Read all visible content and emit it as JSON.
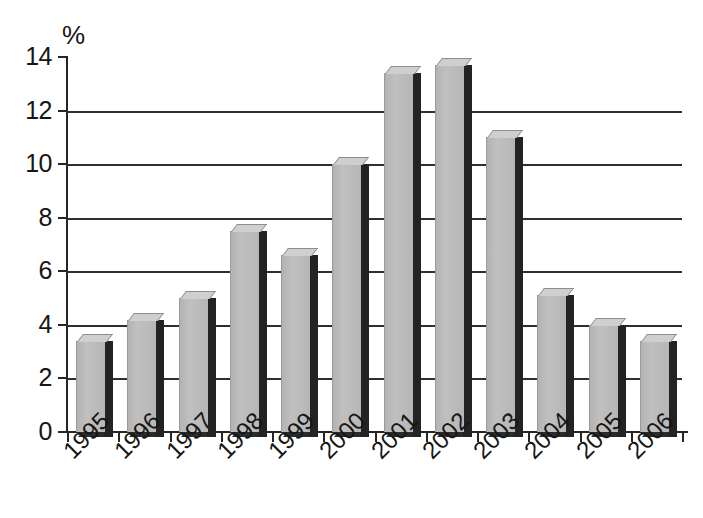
{
  "chart_data": {
    "type": "bar",
    "title": "",
    "subtitle": "",
    "xlabel": "",
    "ylabel": "%",
    "unit_label": "%",
    "categories": [
      "1995",
      "1996",
      "1997",
      "1998",
      "1999",
      "2000",
      "2001",
      "2002",
      "2003",
      "2004",
      "2005",
      "2006"
    ],
    "values": [
      3.4,
      4.2,
      5.0,
      7.5,
      6.6,
      10.0,
      13.4,
      13.7,
      11.0,
      5.1,
      4.0,
      3.4
    ],
    "ylim": [
      0,
      14
    ],
    "yticks": [
      0,
      2,
      4,
      6,
      8,
      10,
      12,
      14
    ],
    "ytick_labels": [
      "0",
      "2",
      "4",
      "6",
      "8",
      "10",
      "12",
      "14"
    ],
    "gridlines": [
      2,
      4,
      6,
      8,
      10,
      12
    ],
    "grid": true,
    "legend": null,
    "legend_position": "none",
    "style": "3d-column",
    "colors": {
      "bar_front": "#b9b9b9",
      "bar_top": "#cfcfcf",
      "bar_side": "#232323",
      "axis": "#262626",
      "grid": "#2e2e2e",
      "text": "#161616",
      "background": "#ffffff"
    }
  }
}
